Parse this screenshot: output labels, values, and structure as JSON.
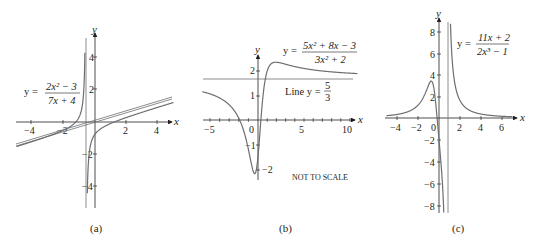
{
  "chart_data": [
    {
      "type": "line",
      "panel": "(a)",
      "title": "y = (2x^2 - 3)/(7x + 4)",
      "equation": {
        "lhs": "y =",
        "numerator": "2x² − 3",
        "denominator": "7x + 4"
      },
      "xlabel": "x",
      "ylabel": "y",
      "xlim": [
        -5,
        5
      ],
      "ylim": [
        -5.5,
        5.3
      ],
      "xticks": [
        -4,
        -2,
        2,
        4
      ],
      "yticks": [
        -4,
        -2,
        2,
        4
      ],
      "xtick_labels": [
        "−4",
        "−2",
        "2",
        "4"
      ],
      "ytick_labels": [
        "−4",
        "−2",
        "2",
        "4"
      ],
      "series": [
        {
          "name": "curve",
          "function": "(2x^2-3)/(7x+4)"
        },
        {
          "name": "slant asymptote",
          "function": "(2/7)x - 8/49"
        },
        {
          "name": "vertical asymptote",
          "x": -0.571
        }
      ],
      "grid": false
    },
    {
      "type": "line",
      "panel": "(b)",
      "title": "y = (5x^2 + 8x - 3)/(3x^2 + 2)",
      "equation": {
        "lhs": "y =",
        "numerator": "5x² + 8x − 3",
        "denominator": "3x² + 2"
      },
      "line_label": {
        "prefix": "Line y =",
        "numerator": "5",
        "denominator": "3"
      },
      "note": "NOT TO SCALE",
      "xlabel": "x",
      "ylabel": "y",
      "xlim": [
        -5.5,
        11
      ],
      "ylim": [
        -2.3,
        2.6
      ],
      "xticks": [
        -5,
        0,
        5,
        10
      ],
      "yticks": [
        -2,
        -1,
        1,
        2
      ],
      "xtick_labels": [
        "−5",
        "0",
        "5",
        "10"
      ],
      "ytick_labels": [
        "−2",
        "−1",
        "1",
        "2"
      ],
      "series": [
        {
          "name": "curve",
          "function": "(5x^2+8x-3)/(3x^2+2)"
        },
        {
          "name": "horizontal asymptote",
          "y": 1.667
        }
      ],
      "grid": false
    },
    {
      "type": "line",
      "panel": "(c)",
      "title": "y = (11x + 2)/(2x^3 - 1)",
      "equation": {
        "lhs": "y =",
        "numerator": "11x + 2",
        "denominator": "2x³ − 1"
      },
      "xlabel": "x",
      "ylabel": "y",
      "xlim": [
        -5,
        7
      ],
      "ylim": [
        -8.5,
        9
      ],
      "xticks": [
        -4,
        -2,
        0,
        2,
        4,
        6
      ],
      "yticks": [
        -8,
        -6,
        -4,
        -2,
        2,
        4,
        6,
        8
      ],
      "xtick_labels": [
        "−4",
        "−2",
        "0",
        "2",
        "4",
        "6"
      ],
      "ytick_labels": [
        "−8",
        "−6",
        "−4",
        "−2",
        "2",
        "4",
        "6",
        "8"
      ],
      "series": [
        {
          "name": "curve",
          "function": "(11x+2)/(2x^3-1)"
        },
        {
          "name": "vertical asymptote",
          "x": 0.794
        }
      ],
      "grid": false
    }
  ],
  "labels": {
    "a": {
      "caption": "(a)",
      "x": "x",
      "y": "y",
      "eq_lhs": "y =",
      "eq_num": "2x² − 3",
      "eq_den": "7x + 4"
    },
    "b": {
      "caption": "(b)",
      "x": "x",
      "y": "y",
      "eq_lhs": "y =",
      "eq_num": "5x² + 8x − 3",
      "eq_den": "3x² + 2",
      "line_prefix": "Line y =",
      "line_num": "5",
      "line_den": "3",
      "note": "NOT TO SCALE"
    },
    "c": {
      "caption": "(c)",
      "x": "x",
      "y": "y",
      "eq_lhs": "y =",
      "eq_num": "11x + 2",
      "eq_den": "2x³ − 1"
    }
  },
  "colors": {
    "curve": "#6d6e71",
    "axis": "#231f20",
    "asymptote": "#6d6e71"
  }
}
